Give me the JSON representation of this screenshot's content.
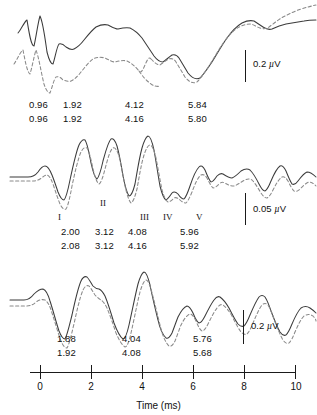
{
  "figure": {
    "axis": {
      "title": "Time (ms)",
      "ticks": [
        {
          "label": "0",
          "value": 0
        },
        {
          "label": "2",
          "value": 2
        },
        {
          "label": "4",
          "value": 4
        },
        {
          "label": "6",
          "value": 6
        },
        {
          "label": "8",
          "value": 8
        },
        {
          "label": "10",
          "value": 10
        }
      ],
      "range": [
        0,
        10
      ],
      "unit": "ms"
    },
    "panels": [
      {
        "id": "top",
        "scale_bar": {
          "value": "0.2",
          "unit": "µV",
          "label": "0.2 µV"
        },
        "wave_labels": [],
        "latency_rows": [
          {
            "trace": "solid",
            "values": [
              "0.96",
              "1.92",
              "4.12",
              "5.84"
            ]
          },
          {
            "trace": "dashed",
            "values": [
              "0.96",
              "1.92",
              "4.16",
              "5.80"
            ]
          }
        ]
      },
      {
        "id": "middle",
        "scale_bar": {
          "value": "0.05",
          "unit": "µV",
          "label": "0.05 µV"
        },
        "wave_labels": [
          "I",
          "II",
          "III",
          "IV",
          "V"
        ],
        "latency_rows": [
          {
            "trace": "solid",
            "values": [
              "2.00",
              "3.12",
              "4.08",
              "5.96"
            ]
          },
          {
            "trace": "dashed",
            "values": [
              "2.08",
              "3.12",
              "4.16",
              "5.92"
            ]
          }
        ]
      },
      {
        "id": "bottom",
        "scale_bar": {
          "value": "0.2",
          "unit": "µV",
          "label": "0.2 µV"
        },
        "wave_labels": [],
        "latency_rows": [
          {
            "trace": "solid",
            "values": [
              "1.88",
              "4.04",
              "5.76"
            ]
          },
          {
            "trace": "dashed",
            "values": [
              "1.92",
              "4.08",
              "5.68"
            ]
          }
        ]
      }
    ]
  },
  "chart_data": {
    "type": "line",
    "title": "",
    "xlabel": "Time (ms)",
    "ylabel": "",
    "xlim": [
      0,
      10
    ],
    "grid": false,
    "legend": "none",
    "panels": [
      {
        "name": "top",
        "amplitude_scale_bar": "0.2 µV",
        "series": [
          {
            "name": "solid",
            "style": "solid",
            "peak_latencies_ms": [
              0.96,
              1.92,
              4.12,
              5.84
            ],
            "x": [
              0.0,
              0.2,
              0.4,
              0.55,
              0.7,
              0.8,
              0.96,
              1.1,
              1.25,
              1.4,
              1.55,
              1.7,
              1.82,
              1.92,
              2.05,
              2.2,
              2.4,
              2.6,
              2.8,
              3.0,
              3.2,
              3.4,
              3.6,
              3.8,
              4.0,
              4.12,
              4.3,
              4.5,
              4.7,
              4.9,
              5.1,
              5.3,
              5.5,
              5.7,
              5.84,
              6.1,
              6.4,
              6.7,
              7.0,
              7.3,
              7.6,
              7.9,
              8.2,
              8.5,
              8.8,
              9.1,
              9.4,
              9.7,
              10.0
            ],
            "y": [
              0.3,
              0.52,
              0.05,
              -0.1,
              0.55,
              0.92,
              0.05,
              -0.62,
              -0.15,
              0.22,
              0.3,
              0.22,
              0.15,
              0.1,
              0.22,
              0.42,
              0.62,
              0.82,
              0.9,
              0.78,
              0.7,
              0.74,
              0.7,
              0.52,
              0.18,
              0.0,
              0.2,
              0.32,
              0.22,
              0.05,
              -0.2,
              -0.45,
              -0.62,
              -0.7,
              -0.74,
              -0.45,
              -0.12,
              0.22,
              0.55,
              0.82,
              1.0,
              1.08,
              1.0,
              0.94,
              1.0,
              1.05,
              1.08,
              1.12,
              1.15
            ]
          },
          {
            "name": "dashed",
            "style": "dashed",
            "peak_latencies_ms": [
              0.96,
              1.92,
              4.16,
              5.8
            ],
            "x": [
              0.0,
              0.2,
              0.4,
              0.55,
              0.7,
              0.8,
              0.96,
              1.1,
              1.25,
              1.4,
              1.55,
              1.7,
              1.82,
              1.92,
              2.05,
              2.2,
              2.4,
              2.6,
              2.8,
              3.0,
              3.2,
              3.4,
              3.6,
              3.8,
              4.0,
              4.16,
              4.3,
              4.5,
              4.7,
              4.9,
              5.1,
              5.3,
              5.5,
              5.7,
              5.8,
              6.1,
              6.4,
              6.7,
              7.0,
              7.3,
              7.6,
              7.9,
              8.2,
              8.5,
              8.8,
              9.1,
              9.4,
              9.7,
              10.0
            ],
            "y": [
              -0.1,
              0.15,
              -0.25,
              -0.4,
              0.15,
              0.45,
              -0.3,
              -0.8,
              -0.45,
              -0.2,
              -0.12,
              -0.18,
              -0.22,
              -0.25,
              -0.12,
              0.08,
              0.32,
              0.52,
              0.58,
              0.5,
              0.46,
              0.5,
              0.46,
              0.34,
              0.1,
              -0.04,
              0.12,
              0.26,
              0.18,
              0.02,
              -0.22,
              -0.48,
              -0.64,
              -0.72,
              -0.74,
              -0.42,
              -0.08,
              0.28,
              0.6,
              0.88,
              1.05,
              1.14,
              1.18,
              1.22,
              1.3,
              1.38,
              1.44,
              1.5,
              1.55
            ]
          }
        ]
      },
      {
        "name": "middle",
        "amplitude_scale_bar": "0.05 µV",
        "wave_labels": [
          "I",
          "II",
          "III",
          "IV",
          "V"
        ],
        "series": [
          {
            "name": "solid",
            "style": "solid",
            "peak_latencies_ms": [
              2.0,
              3.12,
              4.08,
              5.96
            ],
            "x": [
              0.0,
              0.3,
              0.6,
              0.85,
              1.05,
              1.25,
              1.45,
              1.65,
              1.85,
              2.0,
              2.2,
              2.45,
              2.7,
              2.9,
              3.12,
              3.35,
              3.55,
              3.75,
              3.95,
              4.08,
              4.3,
              4.55,
              4.8,
              5.0,
              5.25,
              5.45,
              5.65,
              5.85,
              5.96,
              6.2,
              6.45,
              6.7,
              6.95,
              7.2,
              7.45,
              7.7,
              7.95,
              8.2,
              8.45,
              8.7,
              8.95,
              9.2,
              9.45,
              9.7,
              10.0
            ],
            "y": [
              0.1,
              0.1,
              0.12,
              0.38,
              0.3,
              0.2,
              0.0,
              -0.35,
              -0.52,
              -0.55,
              -0.25,
              0.4,
              0.85,
              0.7,
              0.2,
              -0.25,
              -0.2,
              0.25,
              0.7,
              0.85,
              0.45,
              -0.35,
              -0.75,
              -0.85,
              -0.55,
              -0.35,
              -0.4,
              -0.55,
              -0.6,
              -0.2,
              0.4,
              0.7,
              0.58,
              0.48,
              0.52,
              0.4,
              0.1,
              -0.3,
              -0.5,
              -0.25,
              0.25,
              0.48,
              0.3,
              -0.05,
              -0.2
            ]
          },
          {
            "name": "dashed",
            "style": "dashed",
            "peak_latencies_ms": [
              2.08,
              3.12,
              4.16,
              5.92
            ],
            "x": [
              0.0,
              0.3,
              0.6,
              0.85,
              1.05,
              1.25,
              1.45,
              1.65,
              1.9,
              2.08,
              2.25,
              2.5,
              2.75,
              2.95,
              3.12,
              3.38,
              3.58,
              3.8,
              4.0,
              4.16,
              4.35,
              4.6,
              4.85,
              5.05,
              5.3,
              5.5,
              5.7,
              5.85,
              5.92,
              6.25,
              6.5,
              6.75,
              7.0,
              7.25,
              7.5,
              7.75,
              8.0,
              8.25,
              8.5,
              8.75,
              9.0,
              9.25,
              9.5,
              9.75,
              10.0
            ],
            "y": [
              0.0,
              0.0,
              0.02,
              0.12,
              0.1,
              0.0,
              -0.2,
              -0.55,
              -0.75,
              -0.8,
              -0.45,
              0.25,
              0.62,
              0.48,
              0.02,
              -0.45,
              -0.38,
              0.1,
              0.55,
              0.7,
              0.32,
              -0.45,
              -0.85,
              -0.95,
              -0.7,
              -0.5,
              -0.52,
              -0.62,
              -0.65,
              -0.28,
              0.28,
              0.58,
              0.48,
              0.4,
              0.42,
              0.3,
              0.0,
              -0.4,
              -0.58,
              -0.35,
              0.15,
              0.4,
              0.22,
              -0.12,
              -0.28
            ]
          }
        ]
      },
      {
        "name": "bottom",
        "amplitude_scale_bar": "0.2 µV",
        "series": [
          {
            "name": "solid",
            "style": "solid",
            "peak_latencies_ms": [
              1.88,
              4.04,
              5.76
            ],
            "x": [
              0.0,
              0.3,
              0.6,
              0.85,
              1.05,
              1.25,
              1.45,
              1.65,
              1.88,
              2.1,
              2.35,
              2.6,
              2.8,
              3.0,
              3.2,
              3.45,
              3.7,
              3.9,
              4.04,
              4.3,
              4.55,
              4.8,
              5.05,
              5.3,
              5.55,
              5.76,
              6.0,
              6.3,
              6.6,
              6.85,
              7.1,
              7.35,
              7.6,
              7.85,
              8.1,
              8.35,
              8.6,
              8.85,
              9.1,
              9.35,
              9.6,
              10.0
            ],
            "y": [
              0.22,
              0.25,
              0.4,
              0.48,
              0.45,
              0.3,
              -0.05,
              -0.55,
              -0.8,
              -0.35,
              0.45,
              0.78,
              0.68,
              0.6,
              0.55,
              0.25,
              -0.3,
              -0.7,
              -0.78,
              -0.25,
              0.55,
              0.88,
              0.5,
              -0.15,
              -0.6,
              -0.75,
              -0.55,
              -0.05,
              0.3,
              0.22,
              0.25,
              0.55,
              0.82,
              0.9,
              0.7,
              0.3,
              -0.05,
              -0.18,
              0.05,
              0.3,
              0.4,
              0.38
            ]
          },
          {
            "name": "dashed",
            "style": "dashed",
            "peak_latencies_ms": [
              1.92,
              4.08,
              5.68
            ],
            "x": [
              0.0,
              0.3,
              0.6,
              0.85,
              1.05,
              1.25,
              1.45,
              1.7,
              1.92,
              2.15,
              2.4,
              2.62,
              2.82,
              3.02,
              3.22,
              3.48,
              3.72,
              3.92,
              4.08,
              4.35,
              4.6,
              4.85,
              5.1,
              5.35,
              5.55,
              5.68,
              5.95,
              6.25,
              6.55,
              6.8,
              7.05,
              7.3,
              7.58,
              7.85,
              8.1,
              8.35,
              8.6,
              8.85,
              9.1,
              9.35,
              9.6,
              10.0
            ],
            "y": [
              0.05,
              0.08,
              0.18,
              0.25,
              0.22,
              0.08,
              -0.22,
              -0.65,
              -0.85,
              -0.4,
              0.38,
              0.66,
              0.58,
              0.5,
              0.42,
              0.12,
              -0.38,
              -0.76,
              -0.82,
              -0.3,
              0.48,
              0.78,
              0.42,
              -0.22,
              -0.68,
              -0.82,
              -0.6,
              -0.12,
              0.24,
              0.16,
              0.18,
              0.45,
              0.68,
              0.74,
              0.56,
              0.2,
              -0.12,
              -0.25,
              0.0,
              0.26,
              0.38,
              0.36
            ]
          }
        ]
      }
    ]
  }
}
